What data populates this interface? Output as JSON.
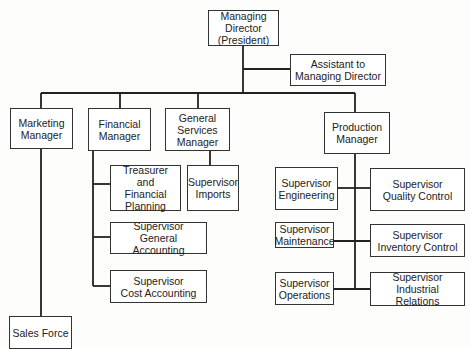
{
  "chart": {
    "type": "org-chart",
    "nodes": {
      "managing_director": {
        "line1": "Managing Director",
        "line2": "(President)"
      },
      "assistant": {
        "line1": "Assistant to",
        "line2": "Managing Director"
      },
      "marketing": {
        "line1": "Marketing",
        "line2": "Manager"
      },
      "financial": {
        "line1": "Financial",
        "line2": "Manager"
      },
      "general_services": {
        "line1": "General",
        "line2": "Services",
        "line3": "Manager"
      },
      "production": {
        "line1": "Production",
        "line2": "Manager"
      },
      "treasurer": {
        "line1": "Treasurer and",
        "line2": "Financial",
        "line3": "Planning"
      },
      "sup_imports": {
        "line1": "Supervisor",
        "line2": "Imports"
      },
      "sup_general_accounting": {
        "line1": "Supervisor",
        "line2": "General Accounting"
      },
      "sup_cost_accounting": {
        "line1": "Supervisor",
        "line2": "Cost Accounting"
      },
      "sales_force": {
        "line1": "Sales Force"
      },
      "sup_engineering": {
        "line1": "Supervisor",
        "line2": "Engineering"
      },
      "sup_quality_control": {
        "line1": "Supervisor",
        "line2": "Quality Control"
      },
      "sup_maintenance": {
        "line1": "Supervisor",
        "line2": "Maintenance"
      },
      "sup_inventory_control": {
        "line1": "Supervisor",
        "line2": "Inventory Control"
      },
      "sup_operations": {
        "line1": "Supervisor",
        "line2": "Operations"
      },
      "sup_industrial_relations": {
        "line1": "Supervisor",
        "line2": "Industrial Relations"
      }
    },
    "edges": [
      [
        "managing_director",
        "assistant"
      ],
      [
        "managing_director",
        "marketing"
      ],
      [
        "managing_director",
        "financial"
      ],
      [
        "managing_director",
        "general_services"
      ],
      [
        "managing_director",
        "production"
      ],
      [
        "marketing",
        "sales_force"
      ],
      [
        "financial",
        "treasurer"
      ],
      [
        "financial",
        "sup_general_accounting"
      ],
      [
        "financial",
        "sup_cost_accounting"
      ],
      [
        "general_services",
        "sup_imports"
      ],
      [
        "production",
        "sup_engineering"
      ],
      [
        "production",
        "sup_quality_control"
      ],
      [
        "production",
        "sup_maintenance"
      ],
      [
        "production",
        "sup_inventory_control"
      ],
      [
        "production",
        "sup_operations"
      ],
      [
        "production",
        "sup_industrial_relations"
      ]
    ]
  }
}
